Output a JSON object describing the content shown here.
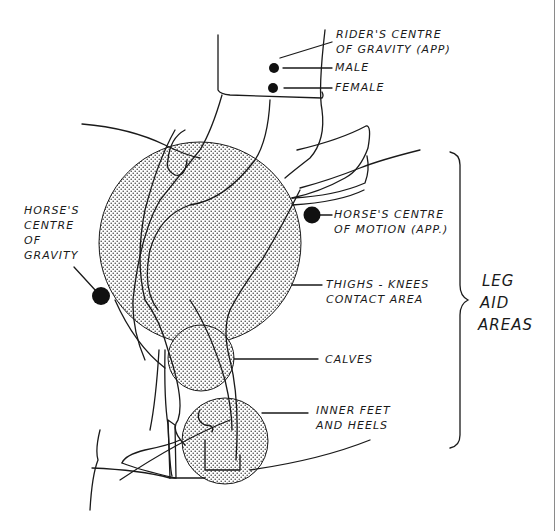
{
  "diagram": {
    "type": "rider leg aid areas illustration",
    "colors": {
      "ink": "#1a1a1a",
      "stipple": "#3a3a3a",
      "background": "#ffffff",
      "edge": "#8a8a8a"
    },
    "labels": {
      "rider_cog_line1": "RIDER'S CENTRE",
      "rider_cog_line2": "OF GRAVITY (APP)",
      "male": "MALE",
      "female": "FEMALE",
      "horse_cog_line1": "HORSE'S",
      "horse_cog_line2": "CENTRE",
      "horse_cog_line3": "OF",
      "horse_cog_line4": "GRAVITY",
      "horse_com_line1": "HORSE'S CENTRE",
      "horse_com_line2": "OF MOTION (APP.)",
      "thighs_line1": "THIGHS - KNEES",
      "thighs_line2": "CONTACT AREA",
      "calves": "CALVES",
      "feet_line1": "INNER FEET",
      "feet_line2": "AND HEELS",
      "group_line1": "LEG",
      "group_line2": "AID",
      "group_line3": "AREAS"
    },
    "markers": [
      {
        "name": "male-cog-dot",
        "x": 274,
        "y": 68
      },
      {
        "name": "female-cog-dot",
        "x": 273,
        "y": 88
      },
      {
        "name": "horse-com-dot",
        "x": 312,
        "y": 215
      },
      {
        "name": "horse-cog-dot",
        "x": 101,
        "y": 296
      }
    ],
    "contact_areas": [
      {
        "name": "thighs-knees-area",
        "cx": 200,
        "cy": 243,
        "r": 101
      },
      {
        "name": "calves-area",
        "cx": 201,
        "cy": 358,
        "r": 33
      },
      {
        "name": "inner-feet-heels-area",
        "cx": 225,
        "cy": 441,
        "r": 43
      }
    ]
  }
}
